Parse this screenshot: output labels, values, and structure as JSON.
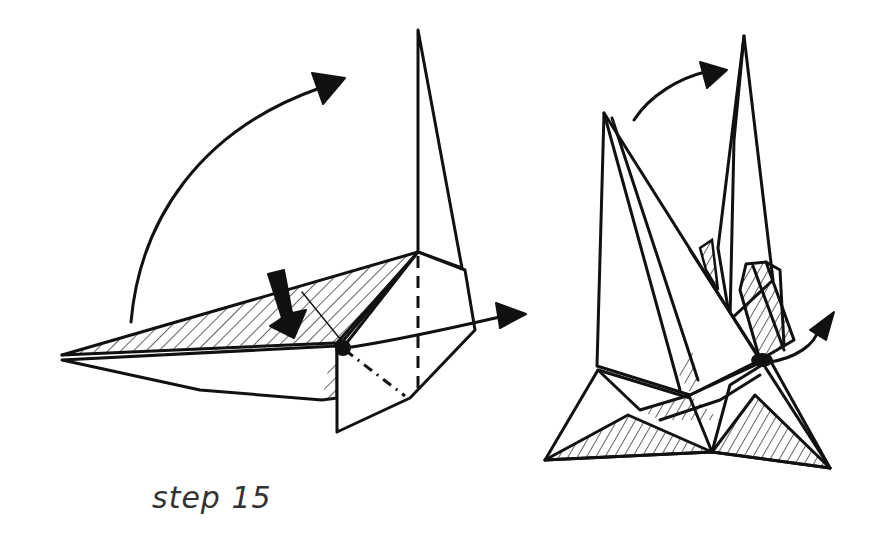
{
  "caption": "step 15",
  "figures": [
    {
      "id": "left",
      "description": "Origami model with hatched flap; black push arrow, curved rotation arrow, and horizontal arrow through a pivot point; dashed valley line and dash-dot mountain line"
    },
    {
      "id": "right",
      "description": "Result view: two tall points with curved rotation arrow above, small curved arrow at right pivot, hatched base triangles"
    }
  ],
  "colors": {
    "ink": "#111111",
    "background": "#ffffff",
    "caption": "#333333"
  }
}
